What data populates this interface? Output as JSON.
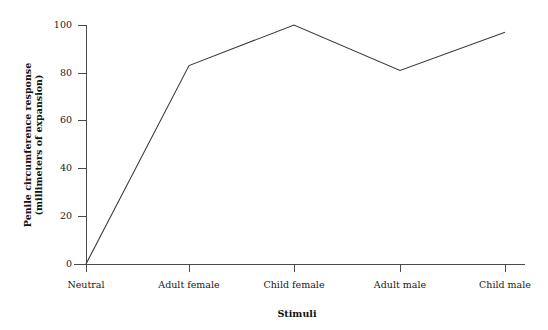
{
  "chart_data": {
    "type": "line",
    "title": "",
    "subtitle": "",
    "xlabel": "Stimuli",
    "ylabel": "Penile circumference response (millimeters of expansion)",
    "ylabel_lines": [
      "Penile circumference response",
      "(millimeters of expansion)"
    ],
    "categories": [
      "Neutral",
      "Adult female",
      "Child female",
      "Adult male",
      "Child male"
    ],
    "values": [
      0,
      83,
      100,
      81,
      97
    ],
    "series": [
      {
        "name": "Penile circumference response",
        "values": [
          0,
          83,
          100,
          81,
          97
        ]
      }
    ],
    "ylim": [
      0,
      100
    ],
    "yticks": [
      0,
      20,
      40,
      60,
      80,
      100
    ],
    "ytick_labels": [
      "0",
      "20",
      "40",
      "60",
      "80",
      "100"
    ],
    "grid": false,
    "legend": "none",
    "line_color": "#3a3a3a",
    "axis_color": "#4a4a4a",
    "background_color": "#ffffff"
  },
  "geometry": {
    "plot_left": 86,
    "plot_right": 525,
    "plot_top": 25,
    "plot_bottom": 264,
    "category_x": [
      86,
      189,
      294,
      400,
      505
    ],
    "ytick_y": [
      264,
      216,
      168,
      120,
      73,
      25
    ],
    "xtick_label_y": 288,
    "xaxis_title_x": 297,
    "xaxis_title_y": 317,
    "yaxis_title_x": 31,
    "yaxis_title_y": 145
  }
}
